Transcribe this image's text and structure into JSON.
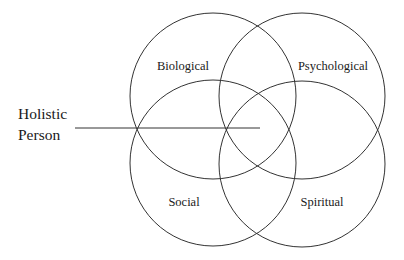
{
  "diagram": {
    "type": "venn",
    "circles": [
      {
        "id": "biological",
        "label": "Biological",
        "cx": 213,
        "cy": 96,
        "r": 83,
        "label_x": 183,
        "label_y": 70
      },
      {
        "id": "psychological",
        "label": "Psychological",
        "cx": 302,
        "cy": 96,
        "r": 83,
        "label_x": 333,
        "label_y": 70
      },
      {
        "id": "social",
        "label": "Social",
        "cx": 213,
        "cy": 163,
        "r": 83,
        "label_x": 184,
        "label_y": 206
      },
      {
        "id": "spiritual",
        "label": "Spiritual",
        "cx": 302,
        "cy": 164,
        "r": 83,
        "label_x": 322,
        "label_y": 206
      }
    ],
    "pointer": {
      "label_line1": "Holistic",
      "label_line2": "Person",
      "x1": 75,
      "y1": 128,
      "x2": 260,
      "y2": 128
    },
    "stroke_color": "#333333"
  }
}
